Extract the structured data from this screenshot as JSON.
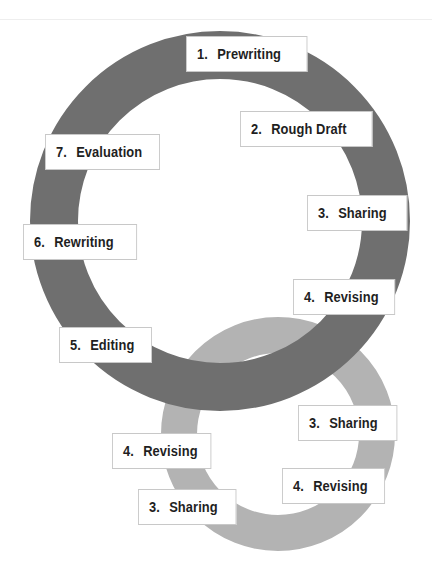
{
  "colors": {
    "main_ring": "#6f6f6f",
    "secondary_ring": "#b3b3b3",
    "label_bg": "#ffffff",
    "label_border": "#c8c8c8",
    "text": "#1f1f1f"
  },
  "main_cycle": {
    "steps": [
      {
        "num": "1.",
        "label": "Prewriting"
      },
      {
        "num": "2.",
        "label": "Rough Draft"
      },
      {
        "num": "3.",
        "label": "Sharing"
      },
      {
        "num": "4.",
        "label": "Revising"
      },
      {
        "num": "5.",
        "label": "Editing"
      },
      {
        "num": "6.",
        "label": "Rewriting"
      },
      {
        "num": "7.",
        "label": "Evaluation"
      }
    ]
  },
  "sub_cycle": {
    "steps": [
      {
        "num": "3.",
        "label": "Sharing"
      },
      {
        "num": "4.",
        "label": "Revising"
      },
      {
        "num": "3.",
        "label": "Sharing"
      },
      {
        "num": "4.",
        "label": "Revising"
      }
    ]
  }
}
